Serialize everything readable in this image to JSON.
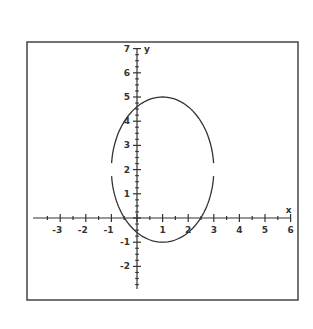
{
  "chart_data": {
    "type": "line",
    "title": "",
    "xlabel": "x",
    "ylabel": "y",
    "xlim": [
      -3.9,
      6
    ],
    "ylim": [
      -2.9,
      7
    ],
    "grid": false,
    "x_ticks": [
      -3,
      -2,
      -1,
      1,
      2,
      3,
      4,
      5,
      6
    ],
    "y_ticks": [
      -2,
      -1,
      1,
      2,
      3,
      4,
      5,
      6,
      7
    ],
    "series": [
      {
        "name": "ellipse",
        "equation": "(x-1)^2/4 + (y-2)^2/9 = 1",
        "center": [
          1,
          2
        ],
        "semi_axis_x": 2,
        "semi_axis_y": 3,
        "extremes": {
          "top": [
            1,
            5
          ],
          "bottom": [
            1,
            -1
          ],
          "left": [
            -1,
            2
          ],
          "right": [
            3,
            2
          ]
        },
        "note": "curve drawn with small gaps at the left and right vertices near y=2"
      }
    ],
    "color": "#333333"
  }
}
